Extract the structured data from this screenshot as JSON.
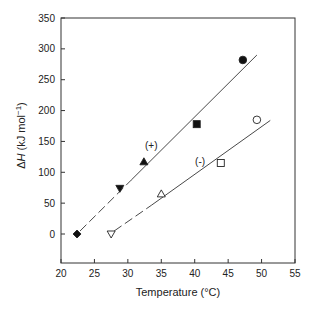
{
  "chart_data": {
    "type": "scatter",
    "title": "",
    "xlabel": "Temperature (°C)",
    "ylabel": "ΔH (kJ mol⁻¹)",
    "xlim": [
      20,
      55
    ],
    "ylim": [
      -47,
      350
    ],
    "xticks": [
      20,
      25,
      30,
      35,
      40,
      45,
      50,
      55
    ],
    "yticks": [
      0,
      50,
      100,
      150,
      200,
      250,
      300,
      350
    ],
    "grid": false,
    "legend": "none",
    "series": [
      {
        "name": "(+)",
        "marker": "filled",
        "points": [
          {
            "x": 22.4,
            "y": 0,
            "marker": "diamond-filled"
          },
          {
            "x": 28.8,
            "y": 74,
            "marker": "triangle-down-filled"
          },
          {
            "x": 32.4,
            "y": 117,
            "marker": "triangle-up-filled"
          },
          {
            "x": 40.3,
            "y": 178,
            "marker": "square-filled"
          },
          {
            "x": 47.2,
            "y": 282,
            "marker": "circle-filled"
          }
        ],
        "fit_line": {
          "x": [
            22.4,
            49.3
          ],
          "y": [
            0,
            290
          ],
          "dashed_until_x": 30.5
        }
      },
      {
        "name": "(-)",
        "marker": "open",
        "points": [
          {
            "x": 27.5,
            "y": 0,
            "marker": "triangle-down-open"
          },
          {
            "x": 35.0,
            "y": 65,
            "marker": "triangle-up-open"
          },
          {
            "x": 43.9,
            "y": 115,
            "marker": "square-open"
          },
          {
            "x": 49.3,
            "y": 185,
            "marker": "circle-open"
          }
        ],
        "fit_line": {
          "x": [
            27.5,
            51.3
          ],
          "y": [
            0,
            184
          ],
          "dashed_until_x": 33.5
        }
      }
    ],
    "annotations": [
      {
        "text": "(+)",
        "x": 33.5,
        "y": 145
      },
      {
        "text": "(-)",
        "x": 40.8,
        "y": 118
      }
    ]
  }
}
